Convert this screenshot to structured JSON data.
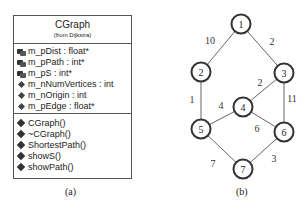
{
  "panel_a": {
    "class_name": "CGraph",
    "package": "(from Dijkstra)",
    "attributes": [
      {
        "icon": "private-member-icon",
        "kind": "priv",
        "text": "m_pDist : float*"
      },
      {
        "icon": "private-member-icon",
        "kind": "priv",
        "text": "m_pPath : int*"
      },
      {
        "icon": "private-member-icon",
        "kind": "priv",
        "text": "m_pS : int*"
      },
      {
        "icon": "protected-member-icon",
        "kind": "prot",
        "text": "m_nNumVertices : int"
      },
      {
        "icon": "protected-member-icon",
        "kind": "prot",
        "text": "m_nOrigin : int"
      },
      {
        "icon": "protected-member-icon",
        "kind": "prot",
        "text": "m_pEdge : float*"
      }
    ],
    "operations": [
      {
        "icon": "public-method-icon",
        "text": "CGraph()"
      },
      {
        "icon": "public-method-icon",
        "text": "~CGraph()"
      },
      {
        "icon": "public-method-icon",
        "text": "ShortestPath()"
      },
      {
        "icon": "public-method-icon",
        "text": "showS()"
      },
      {
        "icon": "public-method-icon",
        "text": "showPath()"
      }
    ],
    "caption": "(a)"
  },
  "panel_b": {
    "caption": "(b)",
    "nodes": [
      {
        "id": "1",
        "x": 241,
        "y": 24
      },
      {
        "id": "2",
        "x": 201,
        "y": 72
      },
      {
        "id": "3",
        "x": 284,
        "y": 73
      },
      {
        "id": "4",
        "x": 243,
        "y": 107
      },
      {
        "id": "5",
        "x": 201,
        "y": 129
      },
      {
        "id": "6",
        "x": 284,
        "y": 132
      },
      {
        "id": "7",
        "x": 243,
        "y": 169
      }
    ],
    "edges": [
      {
        "from": "1",
        "to": "2",
        "weight": "10",
        "lx": 210,
        "ly": 44
      },
      {
        "from": "1",
        "to": "3",
        "weight": "2",
        "lx": 272,
        "ly": 45
      },
      {
        "from": "2",
        "to": "5",
        "weight": "1",
        "lx": 192,
        "ly": 103
      },
      {
        "from": "3",
        "to": "4",
        "weight": "2",
        "lx": 260,
        "ly": 86
      },
      {
        "from": "3",
        "to": "6",
        "weight": "11",
        "lx": 292,
        "ly": 102
      },
      {
        "from": "5",
        "to": "4",
        "weight": "4",
        "lx": 221,
        "ly": 109
      },
      {
        "from": "4",
        "to": "6",
        "weight": "6",
        "lx": 257,
        "ly": 132
      },
      {
        "from": "5",
        "to": "7",
        "weight": "7",
        "lx": 213,
        "ly": 167
      },
      {
        "from": "6",
        "to": "7",
        "weight": "3",
        "lx": 274,
        "ly": 162
      }
    ]
  }
}
